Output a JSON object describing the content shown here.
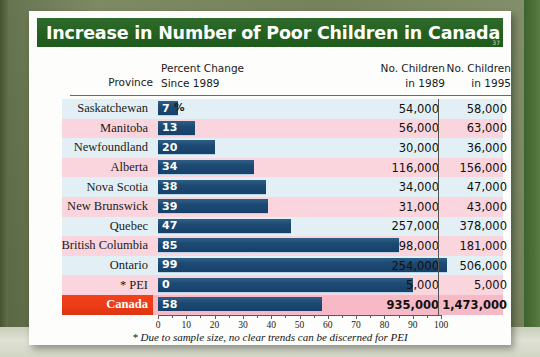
{
  "title": "Increase in Number of Poor Children in Canada",
  "page_marker": "37",
  "header": {
    "province": "Province",
    "percent_change_line1": "Percent Change",
    "percent_change_line2": "Since 1989",
    "children_1989_line1": "No. Children",
    "children_1989_line2": "in 1989",
    "children_1995_line1": "No. Children",
    "children_1995_line2": "in 1995"
  },
  "percent_symbol": "%",
  "footnote": "* Due to sample size, no clear trends can be discerned for PEI",
  "colors": {
    "title_bar": "#24601f",
    "bar": "#1d4a72",
    "total_row": "#ea3a16",
    "stripe_blue": "#e2f0f5",
    "stripe_pink": "#fbd5dd",
    "backdrop": "#6f7d55"
  },
  "axis": {
    "ticks": [
      "0",
      "10",
      "20",
      "30",
      "40",
      "50",
      "60",
      "70",
      "80",
      "90",
      "100"
    ],
    "min": 0,
    "max": 100
  },
  "chart_data": {
    "type": "bar",
    "title": "Increase in Number of Poor Children in Canada",
    "xlabel": "Percent Change Since 1989",
    "ylabel": "Province",
    "xlim": [
      0,
      100
    ],
    "orientation": "horizontal",
    "grid": false,
    "legend": null,
    "categories": [
      "Saskatchewan",
      "Manitoba",
      "Newfoundland",
      "Alberta",
      "Nova Scotia",
      "New Brunswick",
      "Quebec",
      "British Columbia",
      "Ontario",
      "* PEI",
      "Canada"
    ],
    "values": [
      7,
      13,
      20,
      34,
      38,
      39,
      47,
      85,
      99,
      0,
      58
    ],
    "bar_drawn_lengths": [
      7,
      13,
      20,
      34,
      38,
      39,
      47,
      85,
      102,
      90,
      58
    ],
    "series": [
      {
        "name": "No. Children in 1989",
        "values": [
          54000,
          56000,
          30000,
          116000,
          34000,
          31000,
          257000,
          98000,
          254000,
          5000,
          935000
        ],
        "labels": [
          "54,000",
          "56,000",
          "30,000",
          "116,000",
          "34,000",
          "31,000",
          "257,000",
          "98,000",
          "254,000",
          "5,000",
          "935,000"
        ]
      },
      {
        "name": "No. Children in 1995",
        "values": [
          58000,
          63000,
          36000,
          156000,
          47000,
          43000,
          378000,
          181000,
          506000,
          5000,
          1473000
        ],
        "labels": [
          "58,000",
          "63,000",
          "36,000",
          "156,000",
          "47,000",
          "43,000",
          "378,000",
          "181,000",
          "506,000",
          "5,000",
          "1,473,000"
        ]
      }
    ],
    "annotations": [
      "* Due to sample size, no clear trends can be discerned for PEI"
    ]
  },
  "rows": [
    {
      "province": "Saskatchewan",
      "pct": "7",
      "n1989": "54,000",
      "n1995": "58,000",
      "bar": 7,
      "total": false
    },
    {
      "province": "Manitoba",
      "pct": "13",
      "n1989": "56,000",
      "n1995": "63,000",
      "bar": 13,
      "total": false
    },
    {
      "province": "Newfoundland",
      "pct": "20",
      "n1989": "30,000",
      "n1995": "36,000",
      "bar": 20,
      "total": false
    },
    {
      "province": "Alberta",
      "pct": "34",
      "n1989": "116,000",
      "n1995": "156,000",
      "bar": 34,
      "total": false
    },
    {
      "province": "Nova Scotia",
      "pct": "38",
      "n1989": "34,000",
      "n1995": "47,000",
      "bar": 38,
      "total": false
    },
    {
      "province": "New Brunswick",
      "pct": "39",
      "n1989": "31,000",
      "n1995": "43,000",
      "bar": 39,
      "total": false
    },
    {
      "province": "Quebec",
      "pct": "47",
      "n1989": "257,000",
      "n1995": "378,000",
      "bar": 47,
      "total": false
    },
    {
      "province": "British Columbia",
      "pct": "85",
      "n1989": "98,000",
      "n1995": "181,000",
      "bar": 85,
      "total": false
    },
    {
      "province": "Ontario",
      "pct": "99",
      "n1989": "254,000",
      "n1995": "506,000",
      "bar": 102,
      "total": false
    },
    {
      "province": "* PEI",
      "pct": "0",
      "n1989": "5,000",
      "n1995": "5,000",
      "bar": 90,
      "total": false
    },
    {
      "province": "Canada",
      "pct": "58",
      "n1989": "935,000",
      "n1995": "1,473,000",
      "bar": 58,
      "total": true
    }
  ]
}
